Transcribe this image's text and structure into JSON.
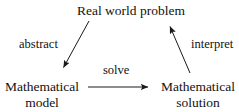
{
  "diagram": {
    "background_color": "#ffffff",
    "stroke_color": "#1a1a1a",
    "text_color": "#111111",
    "nodes": [
      {
        "id": "real-world-problem",
        "label": "Real world problem",
        "line1": "Real world problem",
        "line2": ""
      },
      {
        "id": "mathematical-model",
        "label": "Mathematical model",
        "line1": "Mathematical",
        "line2": "model"
      },
      {
        "id": "mathematical-solution",
        "label": "Mathematical solution",
        "line1": "Mathematical",
        "line2": "solution"
      }
    ],
    "edges": [
      {
        "id": "abstract",
        "label": "abstract",
        "from": "real-world-problem",
        "to": "mathematical-model",
        "direction": "down-left"
      },
      {
        "id": "solve",
        "label": "solve",
        "from": "mathematical-model",
        "to": "mathematical-solution",
        "direction": "right"
      },
      {
        "id": "interpret",
        "label": "interpret",
        "from": "mathematical-solution",
        "to": "real-world-problem",
        "direction": "up-left"
      }
    ]
  }
}
